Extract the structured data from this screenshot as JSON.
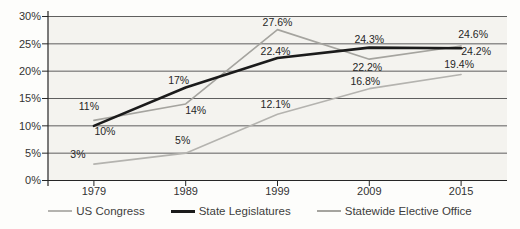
{
  "chart_data": {
    "type": "line",
    "title": "",
    "xlabel": "",
    "ylabel": "",
    "categories": [
      "1979",
      "1989",
      "1999",
      "2009",
      "2015"
    ],
    "y_ticks": [
      "0%",
      "5%",
      "10%",
      "15%",
      "20%",
      "25%",
      "30%"
    ],
    "ylim": [
      0,
      30
    ],
    "grid": "horizontal",
    "legend_position": "bottom",
    "series": [
      {
        "name": "US Congress",
        "color": "#b4b3af",
        "width": 1.6,
        "values": [
          3,
          5,
          12.1,
          16.8,
          19.4
        ],
        "labels": [
          "3%",
          "5%",
          "12.1%",
          "16.8%",
          "19.4%"
        ],
        "label_offsets": [
          [
            -16,
            -6
          ],
          [
            -3,
            -9
          ],
          [
            -2,
            -6
          ],
          [
            -4,
            -4
          ],
          [
            -2,
            -6
          ]
        ]
      },
      {
        "name": "State Legislatures",
        "color": "#1b1b1b",
        "width": 2.6,
        "values": [
          10,
          17,
          22.4,
          24.3,
          24.2
        ],
        "labels": [
          "10%",
          "17%",
          "22.4%",
          "24.3%",
          "24.2%"
        ],
        "label_offsets": [
          [
            11,
            9
          ],
          [
            -7,
            -4
          ],
          [
            -2,
            -3
          ],
          [
            0,
            -5
          ],
          [
            15,
            7
          ]
        ]
      },
      {
        "name": "Statewide Elective Office",
        "color": "#a5a49f",
        "width": 1.6,
        "values": [
          11,
          14,
          27.6,
          22.2,
          24.6
        ],
        "labels": [
          "11%",
          "14%",
          "27.6%",
          "22.2%",
          "24.6%"
        ],
        "label_offsets": [
          [
            -5,
            -10
          ],
          [
            10,
            10
          ],
          [
            0,
            -4
          ],
          [
            -2,
            12
          ],
          [
            12,
            -8
          ]
        ]
      }
    ],
    "colors": {
      "plot_background": "#f4f3ef",
      "page_background": "#fdfdfb",
      "gridline": "#4d4d4d",
      "axis": "#262626",
      "axis_text": "#333333",
      "data_label_text": "#262626"
    }
  }
}
